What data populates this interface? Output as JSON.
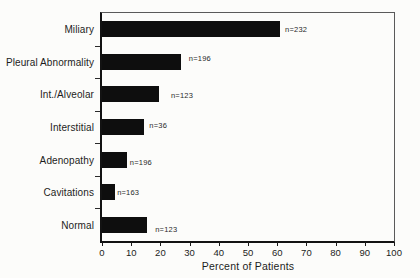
{
  "chart_data": {
    "type": "bar",
    "orientation": "horizontal",
    "title": "",
    "xlabel": "Percent of Patients",
    "ylabel": "",
    "xlim": [
      0,
      100
    ],
    "xticks": [
      0,
      10,
      20,
      30,
      40,
      50,
      60,
      70,
      80,
      90,
      100
    ],
    "grid": "off",
    "legend": "none",
    "categories": [
      "Miliary",
      "Pleural Abnormality",
      "Int./Alveolar",
      "Interstitial",
      "Adenopathy",
      "Cavitations",
      "Normal"
    ],
    "values": [
      61,
      27,
      19.5,
      14.5,
      8.5,
      4.5,
      15.5
    ],
    "bar_labels": [
      "n=232",
      "n=196",
      "n=123",
      "n=36",
      "n=196",
      "n=163",
      "n=123"
    ],
    "bar_color": "#0e0e0e",
    "axis_color": "#121212",
    "frame_color": "#5a5a5a",
    "background_color": "#fcfcfa",
    "text_color": "#1c1c1c",
    "bar_height_px": 16,
    "label_dx_px": [
      5,
      8,
      12,
      5,
      3,
      2,
      8
    ],
    "label_dy_px": [
      0,
      -4,
      1,
      -2,
      2,
      0,
      4
    ]
  }
}
